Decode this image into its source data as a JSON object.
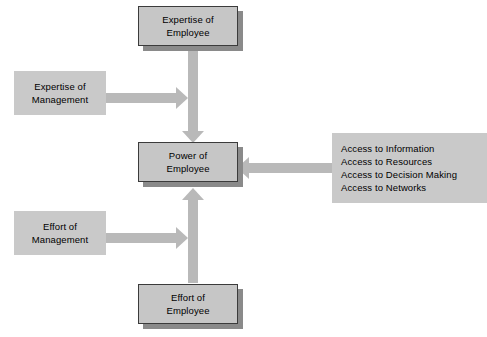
{
  "diagram": {
    "colors": {
      "box_fill": "#c8c8c8",
      "box_border": "#3b3b3b",
      "box_shadow": "#8a8a8a",
      "arrow": "#b9b9b9",
      "background": "#ffffff",
      "text": "#000000"
    },
    "nodes": [
      {
        "id": "expertise-of-employee",
        "lines": [
          "Expertise of",
          "Employee"
        ],
        "style": "bordered-shadow"
      },
      {
        "id": "expertise-of-management",
        "lines": [
          "Expertise of",
          "Management"
        ],
        "style": "plain"
      },
      {
        "id": "power-of-employee",
        "lines": [
          "Power of",
          "Employee"
        ],
        "style": "bordered-shadow"
      },
      {
        "id": "access-sources",
        "lines": [
          "Access to Information",
          "Access to Resources",
          "Access to Decision Making",
          "Access to Networks"
        ],
        "style": "plain"
      },
      {
        "id": "effort-of-management",
        "lines": [
          "Effort of",
          "Management"
        ],
        "style": "plain"
      },
      {
        "id": "effort-of-employee",
        "lines": [
          "Effort of",
          "Employee"
        ],
        "style": "bordered-shadow"
      }
    ],
    "edges": [
      {
        "id": "edge-expertise-employee-to-power",
        "from": "expertise-of-employee",
        "to": "power-of-employee",
        "direction": "down"
      },
      {
        "id": "edge-expertise-management-to-power",
        "from": "expertise-of-management",
        "to": "power-of-employee",
        "direction": "right"
      },
      {
        "id": "edge-access-to-power",
        "from": "access-sources",
        "to": "power-of-employee",
        "direction": "left"
      },
      {
        "id": "edge-effort-management-to-power",
        "from": "effort-of-management",
        "to": "power-of-employee",
        "direction": "right"
      },
      {
        "id": "edge-effort-employee-to-power",
        "from": "effort-of-employee",
        "to": "power-of-employee",
        "direction": "up"
      }
    ]
  }
}
